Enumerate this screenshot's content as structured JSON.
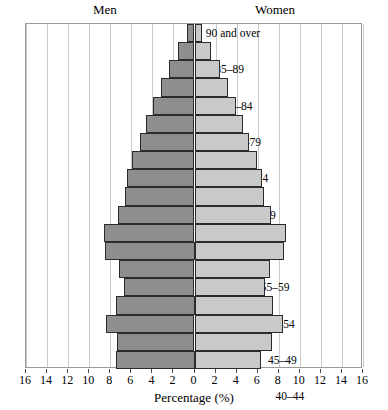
{
  "chart_data": {
    "type": "bar",
    "subtype": "population-pyramid",
    "title": "",
    "xlabel": "Percentage (%)",
    "ylabel": "",
    "xlim": [
      -16,
      16
    ],
    "grid": true,
    "legend_position": "top",
    "categories": [
      "90 and over",
      "85–89",
      "80–84",
      "75–79",
      "70–74",
      "65–69",
      "60–64",
      "55–59",
      "50–54",
      "45–49",
      "40–44",
      "35–39",
      "30–34",
      "25–29",
      "20–24",
      "15–19",
      "10–14",
      "5–9",
      "0–4"
    ],
    "series": [
      {
        "name": "Men",
        "side": "left",
        "color": "#8e8e8e",
        "values": [
          0.7,
          1.6,
          2.4,
          3.2,
          3.9,
          4.6,
          5.2,
          5.9,
          6.4,
          6.6,
          7.3,
          8.6,
          8.5,
          7.2,
          6.7,
          7.5,
          8.4,
          7.4,
          7.5
        ]
      },
      {
        "name": "Women",
        "side": "right",
        "color": "#c9c9c9",
        "values": [
          0.7,
          1.6,
          2.4,
          3.2,
          3.9,
          4.6,
          5.2,
          5.9,
          6.4,
          6.6,
          7.3,
          8.7,
          8.5,
          7.2,
          6.7,
          7.5,
          8.4,
          7.4,
          6.3
        ]
      }
    ],
    "xticks": [
      16,
      14,
      12,
      10,
      8,
      6,
      4,
      2,
      0,
      2,
      4,
      6,
      8,
      10,
      12,
      14,
      16
    ],
    "xtick_values": [
      -16,
      -14,
      -12,
      -10,
      -8,
      -6,
      -4,
      -2,
      0,
      2,
      4,
      6,
      8,
      10,
      12,
      14,
      16
    ]
  },
  "labels": {
    "men": "Men",
    "women": "Women",
    "x_axis_title": "Percentage (%)"
  }
}
